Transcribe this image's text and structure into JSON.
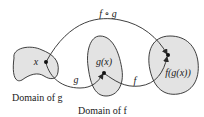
{
  "diagram": {
    "composite_label": "f ∘ g",
    "arrow_g_label": "g",
    "arrow_f_label": "f",
    "point_x_label": "x",
    "point_gx_label": "g(x)",
    "point_fgx_label": "f(g(x))",
    "domain_g_label": "Domain of g",
    "domain_f_label": "Domain of f",
    "colors": {
      "region_fill": "#e3e3e3",
      "stroke": "#2a2a2a",
      "text": "#1a1a1a"
    }
  }
}
